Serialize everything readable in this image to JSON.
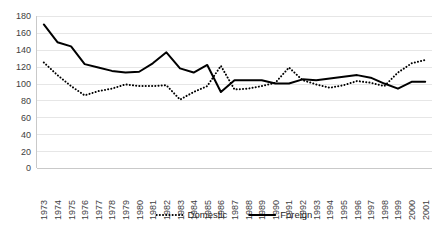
{
  "chart_data": {
    "type": "line",
    "title": "",
    "subtitle": "",
    "xlabel": "",
    "ylabel": "",
    "ylim": [
      0,
      180
    ],
    "ytick_step": 20,
    "yticks": [
      0,
      20,
      40,
      60,
      80,
      100,
      120,
      140,
      160,
      180
    ],
    "grid": true,
    "legend_position": "bottom",
    "categories": [
      "1973",
      "1974",
      "1975",
      "1976",
      "1977",
      "1978",
      "1979",
      "1980",
      "1981",
      "1982",
      "1983",
      "1984",
      "1985",
      "1986",
      "1987",
      "1988",
      "1989",
      "1990",
      "1991",
      "1992",
      "1993",
      "1994",
      "1995",
      "1996",
      "1997",
      "1998",
      "1999",
      "2000",
      "2001"
    ],
    "series": [
      {
        "name": "Domestic",
        "style": "dotted",
        "color": "#000000",
        "values": [
          125,
          110,
          97,
          86,
          91,
          94,
          99,
          97,
          97,
          98,
          81,
          90,
          97,
          121,
          93,
          94,
          97,
          101,
          119,
          104,
          99,
          95,
          98,
          103,
          101,
          97,
          113,
          124,
          128
        ]
      },
      {
        "name": "Foreign",
        "style": "solid",
        "color": "#000000",
        "values": [
          170,
          149,
          144,
          123,
          119,
          115,
          113,
          114,
          124,
          137,
          118,
          113,
          122,
          90,
          104,
          104,
          104,
          100,
          100,
          105,
          104,
          106,
          108,
          110,
          107,
          100,
          94,
          102,
          102
        ]
      }
    ]
  },
  "legend": {
    "items": [
      {
        "label": "Domestic",
        "style": "dotted"
      },
      {
        "label": "Foreign",
        "style": "solid"
      }
    ]
  }
}
